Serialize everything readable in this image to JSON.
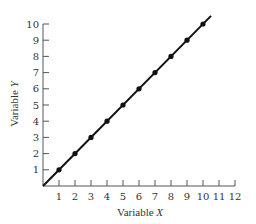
{
  "chart_data": {
    "type": "line",
    "title": "",
    "xlabel": "Variable X",
    "ylabel": "Variable Y",
    "xlim": [
      0,
      12
    ],
    "ylim": [
      0,
      10
    ],
    "x_ticks": [
      1,
      2,
      3,
      4,
      5,
      6,
      7,
      8,
      9,
      10,
      11,
      12
    ],
    "y_ticks": [
      1,
      2,
      3,
      4,
      5,
      6,
      7,
      8,
      9,
      10
    ],
    "grid": false,
    "legend": null,
    "series": [
      {
        "name": "Y = X",
        "x": [
          1,
          2,
          3,
          4,
          5,
          6,
          7,
          8,
          9,
          10
        ],
        "values": [
          1,
          2,
          3,
          4,
          5,
          6,
          7,
          8,
          9,
          10
        ],
        "line_start": [
          0,
          0
        ],
        "line_end": [
          10.5,
          10.5
        ],
        "marker": "filled-circle",
        "color": "#111111"
      }
    ]
  },
  "labels": {
    "xlabel_main": "Variable ",
    "xlabel_var": "X",
    "ylabel_main": "Variable ",
    "ylabel_var": "Y"
  }
}
